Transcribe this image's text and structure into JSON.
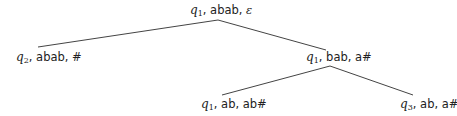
{
  "diagram": {
    "type": "computation-tree",
    "line_color": "#444444",
    "text_color": "#222222",
    "nodes": [
      {
        "id": "root",
        "state": "q",
        "state_sub": "1",
        "input": "abab",
        "stack": "ε"
      },
      {
        "id": "left",
        "state": "q",
        "state_sub": "2",
        "input": "abab",
        "stack": "#"
      },
      {
        "id": "right",
        "state": "q",
        "state_sub": "1",
        "input": "bab",
        "stack": "a#"
      },
      {
        "id": "right-left",
        "state": "q",
        "state_sub": "1",
        "input": "ab",
        "stack": "ab#"
      },
      {
        "id": "right-right",
        "state": "q",
        "state_sub": "3",
        "input": "ab",
        "stack": "a#"
      }
    ],
    "edges": [
      {
        "from": "root",
        "to": "left"
      },
      {
        "from": "root",
        "to": "right"
      },
      {
        "from": "right",
        "to": "right-left"
      },
      {
        "from": "right",
        "to": "right-right"
      }
    ],
    "separator": ", "
  }
}
